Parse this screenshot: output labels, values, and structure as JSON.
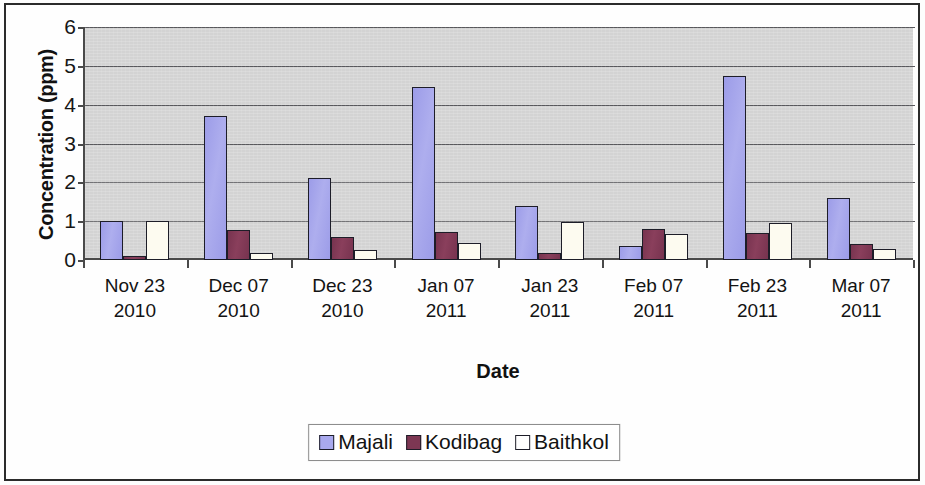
{
  "chart_data": {
    "type": "bar",
    "title": "",
    "xlabel": "Date",
    "ylabel": "Concentration (ppm)",
    "ylim": [
      0,
      6
    ],
    "yticks": [
      0,
      1,
      2,
      3,
      4,
      5,
      6
    ],
    "grid": true,
    "legend_position": "bottom",
    "plot_background": "#d3d3d3",
    "categories": [
      {
        "line1": "Nov 23",
        "line2": "2010"
      },
      {
        "line1": "Dec 07",
        "line2": "2010"
      },
      {
        "line1": "Dec 23",
        "line2": "2010"
      },
      {
        "line1": "Jan 07",
        "line2": "2011"
      },
      {
        "line1": "Jan 23",
        "line2": "2011"
      },
      {
        "line1": "Feb 07",
        "line2": "2011"
      },
      {
        "line1": "Feb 23",
        "line2": "2011"
      },
      {
        "line1": "Mar 07",
        "line2": "2011"
      }
    ],
    "category_labels": [
      "Nov 23 2010",
      "Dec 07 2010",
      "Dec 23 2010",
      "Jan 07 2011",
      "Jan 23 2011",
      "Feb 07 2011",
      "Feb 23 2011",
      "Mar 07 2011"
    ],
    "series": [
      {
        "name": "Majali",
        "color": "#a9a9ee",
        "values": [
          1.0,
          3.7,
          2.1,
          4.45,
          1.4,
          0.35,
          4.75,
          1.6
        ]
      },
      {
        "name": "Kodibag",
        "color": "#7d3753",
        "values": [
          0.1,
          0.78,
          0.58,
          0.72,
          0.17,
          0.8,
          0.7,
          0.4
        ]
      },
      {
        "name": "Baithkol",
        "color": "#fdfbf0",
        "values": [
          1.0,
          0.18,
          0.25,
          0.44,
          0.97,
          0.68,
          0.95,
          0.28
        ]
      }
    ]
  }
}
